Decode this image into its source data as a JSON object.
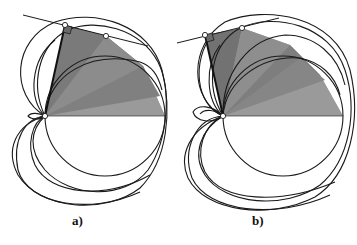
{
  "figure": {
    "panels": [
      {
        "id": "a",
        "label": "a)"
      },
      {
        "id": "b",
        "label": "b)"
      }
    ],
    "colors": {
      "stroke": "#1a1a1a",
      "fill_light": "#9a9a9a",
      "fill_mid": "#808080",
      "fill_dark": "#6e6e6e",
      "background": "#ffffff"
    }
  }
}
